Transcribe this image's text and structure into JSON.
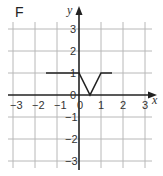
{
  "chart_data": {
    "type": "line",
    "panel_label": "F",
    "title": "",
    "xlabel": "x",
    "ylabel": "y",
    "xlim": [
      -3,
      3
    ],
    "ylim": [
      -3,
      3
    ],
    "x_ticks": [
      "-3",
      "-2",
      "-1",
      "0",
      "1",
      "2",
      "3"
    ],
    "y_ticks": [
      "3",
      "2",
      "1",
      "0",
      "-1",
      "-2",
      "-3"
    ],
    "grid": true,
    "series": [
      {
        "name": "F",
        "x": [
          -1.5,
          0,
          0.5,
          1,
          1.5
        ],
        "y": [
          1,
          1,
          0,
          1,
          1
        ]
      }
    ]
  }
}
